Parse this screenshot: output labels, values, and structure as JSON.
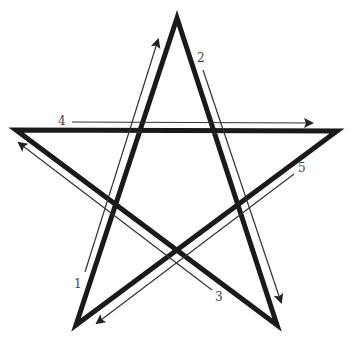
{
  "colors": {
    "star": "#1a1a1a",
    "arrow": "#333333",
    "label": "#444444",
    "background": "#ffffff"
  },
  "star": {
    "vertices": {
      "top": [
        177,
        18
      ],
      "left": [
        16,
        130
      ],
      "right": [
        337,
        131
      ],
      "bottom_left": [
        76,
        325
      ],
      "bottom_right": [
        277,
        325
      ]
    },
    "stroke_width": 5
  },
  "strokes": [
    {
      "step": "1",
      "from": [
        85,
        272
      ],
      "to": [
        158,
        40
      ],
      "label_pos": [
        74,
        278
      ]
    },
    {
      "step": "2",
      "from": [
        203,
        70
      ],
      "to": [
        281,
        302
      ],
      "label_pos": [
        197,
        52
      ]
    },
    {
      "step": "3",
      "from": [
        212,
        290
      ],
      "to": [
        19,
        143
      ],
      "label_pos": [
        215,
        291
      ]
    },
    {
      "step": "4",
      "from": [
        72,
        122
      ],
      "to": [
        312,
        123
      ],
      "label_pos": [
        58,
        115
      ]
    },
    {
      "step": "5",
      "from": [
        294,
        174
      ],
      "to": [
        97,
        323
      ],
      "label_pos": [
        298,
        162
      ]
    }
  ]
}
